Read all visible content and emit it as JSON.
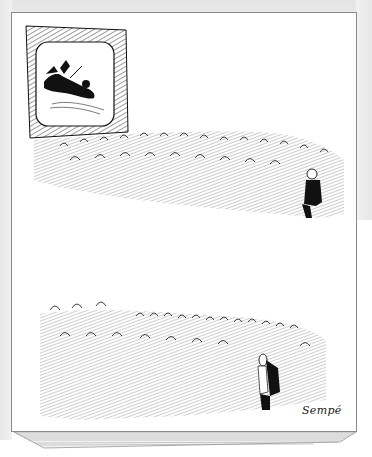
{
  "illustration": {
    "kind": "cartoon drawing on a stack of paper",
    "signature": "Sempé",
    "panels": [
      {
        "name": "top",
        "description": "Crowd of spectators seated facing a television screen showing a falling figure; one man sits apart in the lower right"
      },
      {
        "name": "bottom",
        "description": "Crowd of spectators looking upward; a lone man sits in the lower right"
      }
    ]
  },
  "colors": {
    "ink": "#111111",
    "paper": "#ffffff",
    "page_border": "#8a8a8a",
    "backdrop": "#e8e8e8"
  }
}
